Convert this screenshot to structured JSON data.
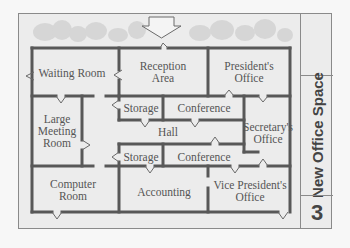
{
  "title_block": {
    "title": "New Office Space",
    "number": "3"
  },
  "colors": {
    "wall": "#585858",
    "background": "#ececec",
    "frame": "#8a8a8a",
    "text": "#555555",
    "shrub": "#d2d2d2"
  },
  "rooms": [
    {
      "name": "Waiting Room",
      "lines": [
        "Waiting Room"
      ]
    },
    {
      "name": "Reception Area",
      "lines": [
        "Reception",
        "Area"
      ]
    },
    {
      "name": "President's Office",
      "lines": [
        "President's",
        "Office"
      ]
    },
    {
      "name": "Large Meeting Room",
      "lines": [
        "Large",
        "Meeting",
        "Room"
      ]
    },
    {
      "name": "Storage (upper)",
      "lines": [
        "Storage"
      ]
    },
    {
      "name": "Conference (upper)",
      "lines": [
        "Conference"
      ]
    },
    {
      "name": "Hall",
      "lines": [
        "Hall"
      ]
    },
    {
      "name": "Secretary's Office",
      "lines": [
        "Secretary's",
        "Office"
      ]
    },
    {
      "name": "Storage (lower)",
      "lines": [
        "Storage"
      ]
    },
    {
      "name": "Conference (lower)",
      "lines": [
        "Conference"
      ]
    },
    {
      "name": "Computer Room",
      "lines": [
        "Computer",
        "Room"
      ]
    },
    {
      "name": "Accounting",
      "lines": [
        "Accounting"
      ]
    },
    {
      "name": "Vice President's Office",
      "lines": [
        "Vice President's",
        "Office"
      ]
    }
  ],
  "entrance": {
    "icon": "entrance-arrow-icon"
  }
}
